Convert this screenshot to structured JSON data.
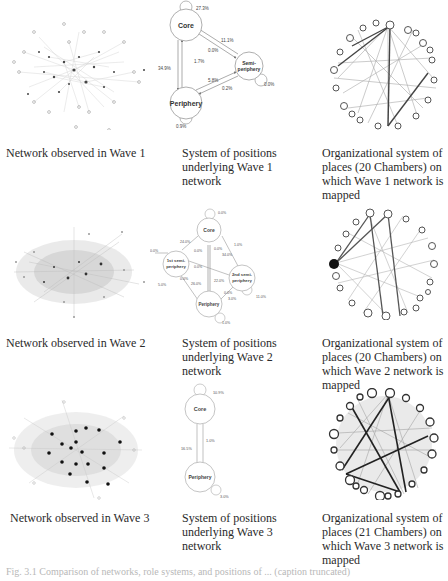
{
  "rows": [
    {
      "wave": "Wave 1",
      "captions": {
        "network": "Network observed in Wave 1",
        "positions": "System of positions underlying Wave 1 network",
        "places": "Organizational system of places (20 Chambers) on which Wave 1 network is mapped"
      },
      "positions_diagram": {
        "nodes": [
          "Core",
          "Semi-periphery",
          "Periphery"
        ],
        "edge_labels": {
          "core_self": "27.3%",
          "semi_to_core": "11.1%",
          "core_to_semi": "0.0%",
          "core_to_periphery": "1.7%",
          "periphery_to_core": "34.9%",
          "periphery_to_semi": "5.8%",
          "semi_to_periphery": "0.2%",
          "semi_self": "0.0%",
          "periphery_self": "0.9%"
        }
      }
    },
    {
      "wave": "Wave 2",
      "captions": {
        "network": "Network observed in Wave 2",
        "positions": "System of positions underlying Wave 2 network",
        "places": "Organizational system of places (20 Chambers) on which Wave 2 network is mapped"
      },
      "positions_diagram": {
        "nodes": [
          "Core",
          "1st semi-periphery",
          "2nd semi-periphery",
          "Periphery"
        ],
        "edge_labels": {
          "core_self": "0.0%",
          "first_to_core": "24.0%",
          "core_to_first": "0.0%",
          "first_self": "0.0%",
          "core_to_second": "0.0%",
          "second_to_core": "1.0%",
          "second_to_core_b": "34.0%",
          "first_to_second": "0.0%",
          "second_to_first": "22.0%",
          "first_to_periphery": "5.0%",
          "periphery_to_first": "0.0%",
          "periphery_to_first_b": "26.0%",
          "second_to_periphery": "0.0%",
          "periphery_to_second": "3.0%",
          "second_self": "11.0%",
          "periphery_self": "1.0%"
        }
      }
    },
    {
      "wave": "Wave 3",
      "captions": {
        "network": "Network observed in Wave 3",
        "positions": "System of positions underlying Wave 3 network",
        "places": "Organizational system of places (21 Chambers) on which Wave 3 network is mapped"
      },
      "positions_diagram": {
        "nodes": [
          "Core",
          "Periphery"
        ],
        "edge_labels": {
          "core_self": "10.9%",
          "core_to_periphery": "1.0%",
          "periphery_to_core": "16.5%",
          "periphery_self": "3.0%"
        }
      }
    }
  ],
  "footer": "Fig. 3.1  Comparison of networks, role systems, and positions of ... (caption truncated)"
}
